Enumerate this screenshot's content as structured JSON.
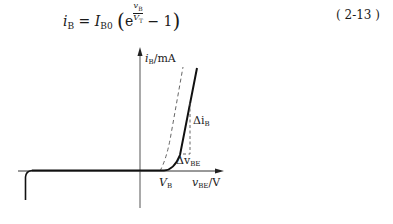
{
  "equation": {
    "lhs": "i",
    "lhs_sub": "B",
    "equals": "=",
    "coef": "I",
    "coef_sub": "B0",
    "exp_base": "e",
    "exp_num": "v",
    "exp_num_sub": "B",
    "exp_den": "V",
    "exp_den_sub": "T",
    "minus_one": "− 1",
    "number": "( 2-13 )"
  },
  "figure": {
    "y_axis_label": "i",
    "y_axis_sub": "B",
    "y_axis_unit": "/mA",
    "x_axis_label": "v",
    "x_axis_sub": "BE",
    "x_axis_unit": "/V",
    "threshold_label": "V",
    "threshold_sub": "B",
    "delta_i_label": "Δi",
    "delta_i_sub": "B",
    "delta_v_label": "Δv",
    "delta_v_sub": "BE",
    "colors": {
      "curve": "#1a1a1a",
      "axis": "#444444",
      "dashed": "#555555"
    }
  }
}
